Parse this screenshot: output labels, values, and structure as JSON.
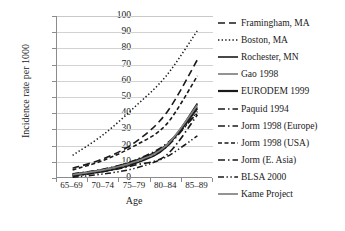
{
  "chart_data": {
    "type": "line",
    "title": "",
    "xlabel": "Age",
    "ylabel": "Incidence rate per 1000",
    "categories": [
      "65–69",
      "70–74",
      "75–79",
      "80–84",
      "85–89"
    ],
    "ylim": [
      0,
      100
    ],
    "yticks": [
      "0",
      "10",
      "20",
      "30",
      "40",
      "50",
      "60",
      "70",
      "80",
      "90",
      "100"
    ],
    "grid": "horizontal",
    "legend_position": "right",
    "series": [
      {
        "name": "Framingham, MA",
        "style": "dashed",
        "color": "#1a1a1a",
        "width": 1.6,
        "values": [
          6.0,
          12.0,
          22.0,
          40.0,
          73.0
        ]
      },
      {
        "name": "Boston, MA",
        "style": "dotted",
        "color": "#1a1a1a",
        "width": 1.5,
        "values": [
          14.0,
          27.0,
          44.0,
          63.0,
          91.0
        ]
      },
      {
        "name": "Rochester, MN",
        "style": "solid",
        "color": "#1a1a1a",
        "width": 1.6,
        "values": [
          1.5,
          4.0,
          9.0,
          19.0,
          46.0
        ]
      },
      {
        "name": "Gao 1998",
        "style": "solid",
        "color": "#808080",
        "width": 1.7,
        "values": [
          2.0,
          5.0,
          10.0,
          20.0,
          44.0
        ]
      },
      {
        "name": "EURODEM 1999",
        "style": "solid",
        "color": "#1a1a1a",
        "width": 2.2,
        "values": [
          2.2,
          5.0,
          10.5,
          20.0,
          43.0
        ]
      },
      {
        "name": "Paquid 1994",
        "style": "dash-dot",
        "color": "#1a1a1a",
        "width": 1.7,
        "values": [
          1.0,
          4.0,
          8.0,
          14.0,
          39.0
        ]
      },
      {
        "name": "Jorm 1998 (Europe)",
        "style": "dash-dot",
        "color": "#1a1a1a",
        "width": 1.7,
        "values": [
          2.5,
          5.5,
          11.0,
          21.0,
          40.0
        ]
      },
      {
        "name": "Jorm 1998 (USA)",
        "style": "dashed-short",
        "color": "#1a1a1a",
        "width": 1.6,
        "values": [
          5.0,
          11.0,
          20.0,
          33.0,
          63.0
        ]
      },
      {
        "name": "Jorm (E. Asia)",
        "style": "dash-dot",
        "color": "#1a1a1a",
        "width": 1.6,
        "values": [
          1.8,
          4.5,
          9.5,
          19.0,
          41.0
        ]
      },
      {
        "name": "BLSA 2000",
        "style": "dash-dot-dot",
        "color": "#1a1a1a",
        "width": 1.5,
        "values": [
          0.5,
          2.5,
          6.0,
          13.0,
          26.0
        ]
      },
      {
        "name": "Kame Project",
        "style": "solid",
        "color": "#808080",
        "width": 1.7,
        "values": [
          2.0,
          5.0,
          10.0,
          20.0,
          45.0
        ]
      }
    ]
  }
}
